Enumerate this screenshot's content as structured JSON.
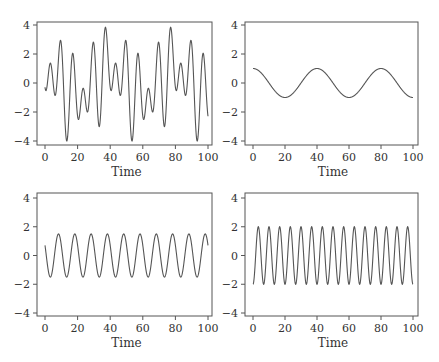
{
  "chart_data": [
    {
      "type": "line",
      "panel": "top-left",
      "title": "",
      "xlabel": "Time",
      "ylabel": "",
      "xlim": [
        0,
        100
      ],
      "ylim": [
        -4.3,
        4.3
      ],
      "xticks": [
        "0",
        "20",
        "40",
        "60",
        "80",
        "100"
      ],
      "yticks": [
        "4",
        "2",
        "0",
        "-2",
        "-4"
      ],
      "grid": false,
      "description": "Sum of the other three series",
      "series": [
        {
          "name": "sum",
          "components": [
            {
              "amp": 1.0,
              "period": 40,
              "phase": 0
            },
            {
              "amp": 1.5,
              "period": 10,
              "phase": 1.08
            },
            {
              "amp": -2.0,
              "period": 6.6667,
              "phase": 0
            }
          ]
        }
      ],
      "key_points": {
        "x": [
          0,
          14,
          37.5,
          54,
          77.5,
          94,
          100
        ],
        "y": [
          -0.3,
          -4.0,
          4.2,
          -4.0,
          4.2,
          -4.0,
          -1.8
        ]
      }
    },
    {
      "type": "line",
      "panel": "top-right",
      "xlabel": "Time",
      "xlim": [
        0,
        100
      ],
      "ylim": [
        -4.3,
        4.3
      ],
      "xticks": [
        "0",
        "20",
        "40",
        "60",
        "80",
        "100"
      ],
      "yticks": [
        "4",
        "2",
        "0",
        "-2",
        "-4"
      ],
      "grid": false,
      "series": [
        {
          "name": "cos period 40",
          "components": [
            {
              "amp": 1.0,
              "period": 40,
              "phase": 0
            }
          ]
        }
      ],
      "key_points": {
        "x": [
          0,
          20,
          40,
          60,
          80,
          100
        ],
        "y": [
          1,
          -1,
          1,
          -1,
          1,
          -1
        ]
      }
    },
    {
      "type": "line",
      "panel": "bottom-left",
      "xlabel": "Time",
      "xlim": [
        0,
        100
      ],
      "ylim": [
        -4.3,
        4.3
      ],
      "xticks": [
        "0",
        "20",
        "40",
        "60",
        "80",
        "100"
      ],
      "yticks": [
        "4",
        "2",
        "0",
        "-2",
        "-4"
      ],
      "grid": false,
      "series": [
        {
          "name": "cos period 10",
          "components": [
            {
              "amp": 1.5,
              "period": 10,
              "phase": 1.08
            }
          ]
        }
      ],
      "key_points": {
        "x": [
          0,
          3.3,
          8.3,
          13.3,
          98.3,
          100
        ],
        "y": [
          0.7,
          -1.5,
          1.5,
          -1.5,
          1.5,
          0.7
        ]
      }
    },
    {
      "type": "line",
      "panel": "bottom-right",
      "xlabel": "Time",
      "xlim": [
        0,
        100
      ],
      "ylim": [
        -4.3,
        4.3
      ],
      "xticks": [
        "0",
        "20",
        "40",
        "60",
        "80",
        "100"
      ],
      "yticks": [
        "4",
        "2",
        "0",
        "-2",
        "-4"
      ],
      "grid": false,
      "series": [
        {
          "name": "cos period 6.67",
          "components": [
            {
              "amp": -2.0,
              "period": 6.6667,
              "phase": 0
            }
          ]
        }
      ],
      "key_points": {
        "x": [
          0,
          3.33,
          6.67,
          10,
          96.67,
          100
        ],
        "y": [
          -2,
          2,
          -2,
          2,
          2,
          -2
        ]
      }
    }
  ],
  "panels": [
    {
      "x0": 37,
      "y0": 22,
      "w": 175,
      "h": 123,
      "px0": 45,
      "px100": 208,
      "py4": 25,
      "pym4": 141
    },
    {
      "x0": 245,
      "y0": 22,
      "w": 173,
      "h": 123,
      "px0": 253,
      "px100": 413,
      "py4": 25,
      "pym4": 141
    },
    {
      "x0": 37,
      "y0": 193,
      "w": 175,
      "h": 123,
      "px0": 45,
      "px100": 208,
      "py4": 198,
      "pym4": 313
    },
    {
      "x0": 245,
      "y0": 193,
      "w": 173,
      "h": 123,
      "px0": 253,
      "px100": 413,
      "py4": 198,
      "pym4": 313
    }
  ],
  "colors": {
    "line": "#555555",
    "axis": "#555555",
    "text": "#333333"
  }
}
